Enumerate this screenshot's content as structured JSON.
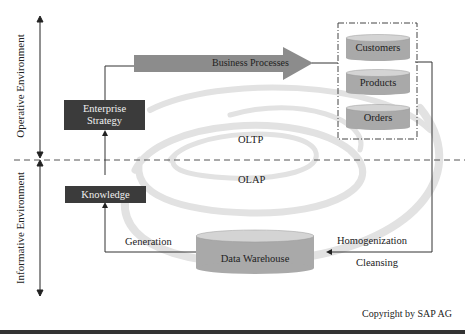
{
  "diagram": {
    "axis_labels": {
      "top": "Operative Environment",
      "bottom": "Informative Environment"
    },
    "boxes": {
      "enterprise_strategy": "Enterprise Strategy",
      "enterprise_strategy_line1": "Enterprise",
      "enterprise_strategy_line2": "Strategy",
      "knowledge": "Knowledge"
    },
    "arrow": {
      "business_processes": "Business Processes"
    },
    "databases": {
      "customers": "Customers",
      "products": "Products",
      "orders": "Orders",
      "data_warehouse": "Data Warehouse"
    },
    "labels": {
      "oltp": "OLTP",
      "olap": "OLAP",
      "generation": "Generation",
      "homogenization": "Homogenization",
      "cleansing": "Cleansing"
    },
    "copyright": "Copyright by SAP AG",
    "colors": {
      "dark_box": "#3b3b3b",
      "cylinder": "#a9a9a9",
      "cylinder_top": "#d4d4d4",
      "arrow": "#8c8c8c",
      "swirl": "#e3e3e3"
    }
  }
}
